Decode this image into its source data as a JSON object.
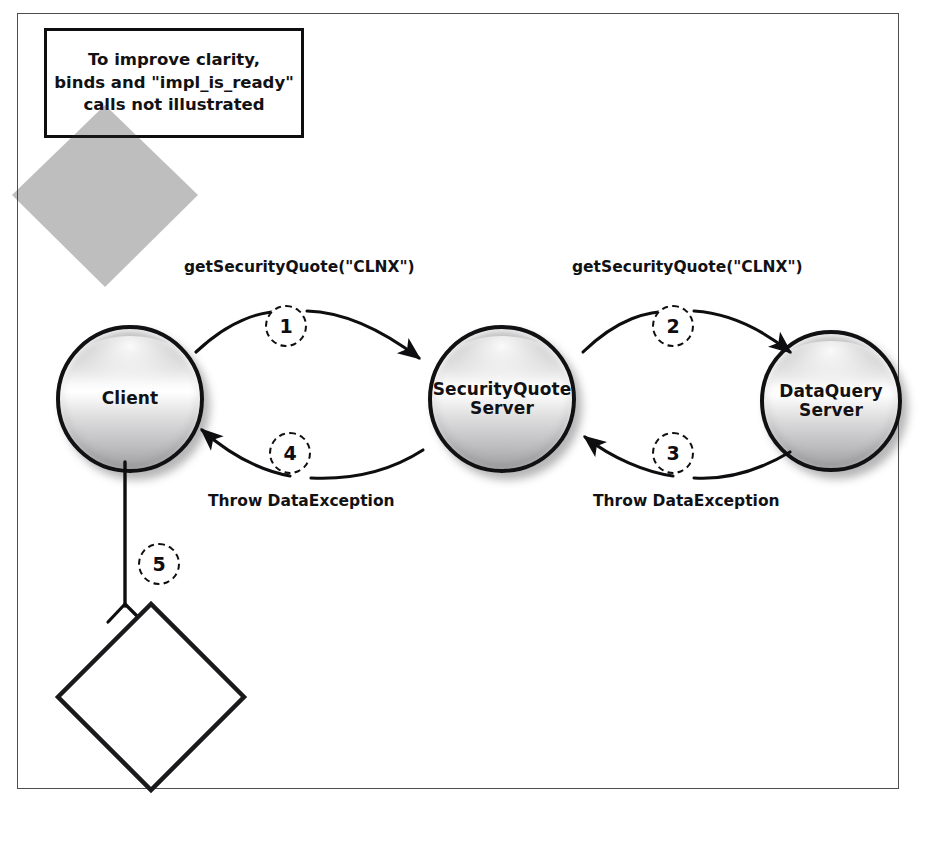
{
  "diagram": {
    "note": {
      "line1": "To improve clarity,",
      "line2": "binds and \"impl_is_ready\"",
      "line3": "calls not illustrated"
    },
    "nodes": [
      {
        "id": "client",
        "label_line1": "Client",
        "label_line2": "",
        "shape": "sphere"
      },
      {
        "id": "securityquote-server",
        "label_line1": "SecurityQuote",
        "label_line2": "Server",
        "shape": "sphere"
      },
      {
        "id": "dataquery-server",
        "label_line1": "DataQuery",
        "label_line2": "Server",
        "shape": "sphere"
      }
    ],
    "decision": {
      "line1": "Catch and",
      "line2": "Process",
      "line3": "Exception",
      "shape": "diamond"
    },
    "steps": [
      {
        "number": "1",
        "label": "getSecurityQuote(\"CLNX\")",
        "from": "client",
        "to": "securityquote-server"
      },
      {
        "number": "2",
        "label": "getSecurityQuote(\"CLNX\")",
        "from": "securityquote-server",
        "to": "dataquery-server"
      },
      {
        "number": "3",
        "label": "Throw DataException",
        "from": "dataquery-server",
        "to": "securityquote-server"
      },
      {
        "number": "4",
        "label": "Throw DataException",
        "from": "securityquote-server",
        "to": "client"
      },
      {
        "number": "5",
        "label": "",
        "from": "client",
        "to": "decision"
      }
    ],
    "colors": {
      "stroke": "#0e0e10",
      "frame": "#4e4e52",
      "background": "#ffffff",
      "sphere_light": "#ffffff",
      "sphere_dark": "#a8a8aa"
    }
  }
}
